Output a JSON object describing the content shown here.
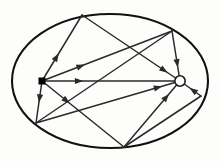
{
  "figure": {
    "type": "node-link-diagram",
    "canvas": {
      "width": 221,
      "height": 161
    },
    "colors": {
      "background": "#fdfdfc",
      "stroke": "#1b1b1b",
      "ellipse_stroke": "#111111",
      "edge_stroke": "#2a2a2a",
      "node_fill_source": "#000000",
      "node_fill_sink": "#ffffff"
    },
    "boundary": {
      "shape": "ellipse",
      "cx": 110,
      "cy": 81,
      "rx": 98,
      "ry": 67,
      "stroke_width": 2.1
    },
    "nodes": [
      {
        "id": "s",
        "name": "source-node",
        "shape": "square",
        "fill": "#000000",
        "x": 42,
        "y": 81,
        "size": 7
      },
      {
        "id": "t",
        "name": "sink-node",
        "shape": "circle-open",
        "fill": "#ffffff",
        "x": 180,
        "y": 81,
        "r": 5.2
      },
      {
        "id": "a",
        "name": "boundary-node-top",
        "shape": "point",
        "x": 82,
        "y": 15
      },
      {
        "id": "b",
        "name": "boundary-node-top-right",
        "shape": "point",
        "x": 172,
        "y": 31
      },
      {
        "id": "c",
        "name": "boundary-node-right",
        "shape": "point",
        "x": 201,
        "y": 96
      },
      {
        "id": "d",
        "name": "boundary-node-bottom",
        "shape": "point",
        "x": 124,
        "y": 147
      },
      {
        "id": "e",
        "name": "boundary-node-lower-left",
        "shape": "point",
        "x": 36,
        "y": 123
      }
    ],
    "edges": [
      {
        "id": "e1",
        "name": "edge-source-to-top",
        "from": "s",
        "to": "a",
        "arrow_at": 0.42,
        "directed": true
      },
      {
        "id": "e2",
        "name": "edge-source-to-top-right",
        "from": "s",
        "to": "b",
        "arrow_at": 0.33,
        "directed": true
      },
      {
        "id": "e3",
        "name": "edge-source-to-sink",
        "from": "s",
        "to": "t",
        "arrow_at": 0.3,
        "directed": true
      },
      {
        "id": "e4",
        "name": "edge-source-to-bottom",
        "from": "s",
        "to": "d",
        "arrow_at": 0.34,
        "directed": true
      },
      {
        "id": "e5",
        "name": "edge-source-to-lower-left",
        "from": "s",
        "to": "e",
        "arrow_at": 0.52,
        "directed": true
      },
      {
        "id": "e6",
        "name": "edge-top-to-sink",
        "from": "a",
        "to": "t",
        "arrow_at": 0.93,
        "directed": true
      },
      {
        "id": "e7",
        "name": "edge-top-right-to-sink",
        "from": "b",
        "to": "t",
        "arrow_at": 0.86,
        "directed": true
      },
      {
        "id": "e8",
        "name": "edge-right-to-sink",
        "from": "c",
        "to": "t",
        "arrow_at": 0.8,
        "directed": true
      },
      {
        "id": "e9",
        "name": "edge-bottom-to-sink",
        "from": "d",
        "to": "t",
        "arrow_at": 0.88,
        "directed": true
      },
      {
        "id": "e10",
        "name": "edge-lower-left-to-sink",
        "from": "e",
        "to": "t",
        "arrow_at": 0.92,
        "directed": true
      },
      {
        "id": "e11",
        "name": "edge-top-right-to-lower-left",
        "from": "b",
        "to": "e",
        "arrow_at": 1.0,
        "directed": false
      },
      {
        "id": "e12",
        "name": "edge-right-to-bottom",
        "from": "c",
        "to": "d",
        "arrow_at": 1.0,
        "directed": false
      }
    ]
  }
}
